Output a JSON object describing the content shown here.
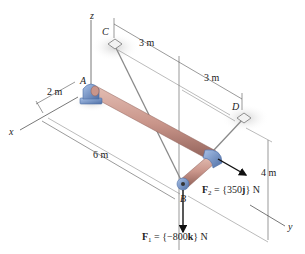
{
  "diagram": {
    "axes": {
      "x": "x",
      "y": "y",
      "z": "z"
    },
    "points": {
      "A": "A",
      "B": "B",
      "C": "C",
      "D": "D"
    },
    "dimensions": {
      "ac_offset": "2 m",
      "c_to_mid": "3 m",
      "mid_to_d": "3 m",
      "rod_length": "6 m",
      "height": "4 m"
    },
    "forces": {
      "F1": {
        "name": "F",
        "sub": "1",
        "expr": " = {−800",
        "unit": "k",
        "tail": "} N"
      },
      "F2": {
        "name": "F",
        "sub": "2",
        "expr": " = {350",
        "unit": "j",
        "tail": "} N"
      }
    },
    "colors": {
      "rod": "#c9958a",
      "rod_dark": "#9a6a62",
      "bracket": "#7f9fd0",
      "bracket_dark": "#4f6fa6",
      "cable": "#8a8a8a",
      "shadow": "#d9d9d9"
    }
  }
}
